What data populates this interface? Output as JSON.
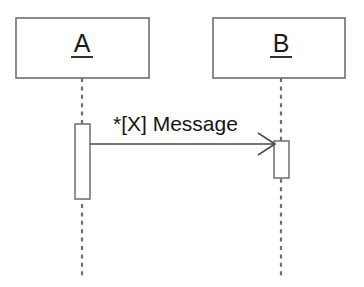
{
  "diagram": {
    "kind": "uml-sequence-diagram",
    "width": 364,
    "height": 287,
    "background_color": "#ffffff",
    "line_color": "#6e6e6e",
    "text_color": "#1a1a1a",
    "message_color": "#4a4a4a"
  },
  "participants": [
    {
      "id": "a",
      "label": "A",
      "underlined": true,
      "box": {
        "x": 16,
        "y": 18,
        "width": 133,
        "height": 60
      },
      "label_x": 82,
      "label_y": 52,
      "underline": {
        "x1": 71,
        "x2": 93,
        "y": 57
      },
      "lifeline": {
        "x": 82,
        "y1": 78,
        "y2": 277
      },
      "activation": {
        "x": 75,
        "y": 124,
        "width": 15,
        "height": 75
      }
    },
    {
      "id": "b",
      "label": "B",
      "underlined": true,
      "box": {
        "x": 213,
        "y": 18,
        "width": 132,
        "height": 60
      },
      "label_x": 281,
      "label_y": 52,
      "underline": {
        "x1": 270,
        "x2": 292,
        "y": 57
      },
      "lifeline": {
        "x": 281,
        "y1": 78,
        "y2": 277
      },
      "activation": {
        "x": 274,
        "y": 141,
        "width": 15,
        "height": 37
      }
    }
  ],
  "messages": [
    {
      "id": "msg-1",
      "label": "*[X] Message",
      "iteration_marker": "*",
      "guard": "[X]",
      "name": "Message",
      "from": "a",
      "to": "b",
      "arrow_style": "open",
      "line": {
        "x1": 90,
        "y1": 144,
        "x2": 274,
        "y2": 144
      },
      "arrowhead": {
        "tip_x": 274,
        "tip_y": 144,
        "back_x": 258,
        "top_y": 133,
        "bottom_y": 155
      },
      "label_x": 113,
      "label_y": 131
    }
  ]
}
